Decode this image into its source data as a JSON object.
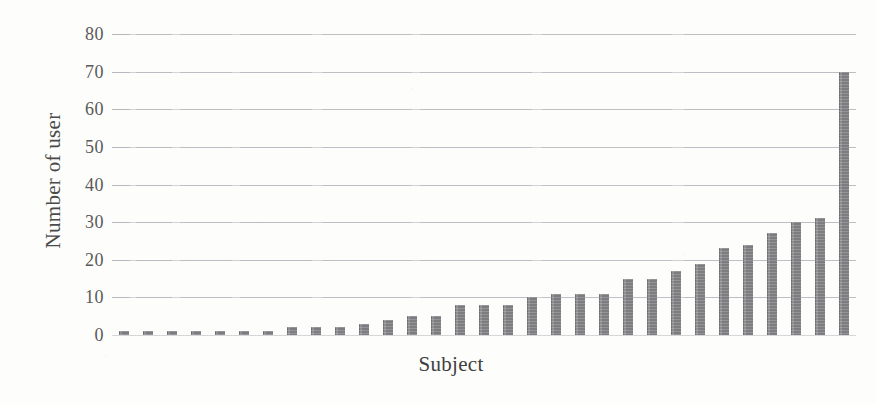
{
  "chart_data": {
    "type": "bar",
    "title": "",
    "subtitle": "",
    "xlabel": "Subject",
    "ylabel": "Number of user",
    "ylim": [
      0,
      80
    ],
    "ytick_labels": [
      "80",
      "70",
      "60",
      "50",
      "40",
      "30",
      "20",
      "10",
      "0"
    ],
    "ytick_values": [
      80,
      70,
      60,
      50,
      40,
      30,
      20,
      10,
      0
    ],
    "xtick_labels": [],
    "grid": true,
    "legend": null,
    "legend_position": "none",
    "bar_color": "#8b8b8f",
    "background_color": "#fdfdfb",
    "categories": [
      "S1",
      "S2",
      "S3",
      "S4",
      "S5",
      "S6",
      "S7",
      "S8",
      "S9",
      "S10",
      "S11",
      "S12",
      "S13",
      "S14",
      "S15",
      "S16",
      "S17",
      "S18",
      "S19",
      "S20",
      "S21",
      "S22",
      "S23",
      "S24",
      "S25",
      "S26",
      "S27",
      "S28"
    ],
    "values": [
      1,
      1,
      1,
      1,
      1,
      1,
      1,
      2,
      2,
      2,
      3,
      4,
      5,
      5,
      8,
      8,
      8,
      10,
      11,
      11,
      11,
      15,
      15,
      17,
      19,
      23,
      24,
      27
    ],
    "values_tail": [
      30,
      31,
      70
    ]
  },
  "axes": {
    "y_title": "Number of user",
    "x_title": "Subject"
  }
}
